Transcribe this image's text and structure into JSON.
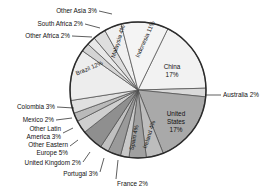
{
  "chart_data": {
    "type": "pie",
    "title": "",
    "subtitle": "",
    "xlabel": "",
    "ylabel": "",
    "legend_position": "none",
    "grid": false,
    "units": "percent",
    "categories": [
      "China",
      "Australia",
      "United States",
      "Ireland",
      "Spain",
      "France",
      "Portugal",
      "United Kingdom",
      "Other Eastern Europe",
      "Other Latin America",
      "Mexico",
      "Colombia",
      "Brazil",
      "Other Africa",
      "South Africa",
      "Other Asia",
      "Malaysia",
      "Indonesia"
    ],
    "values": [
      17,
      2,
      17,
      4,
      4,
      2,
      3,
      2,
      5,
      3,
      2,
      3,
      12,
      2,
      2,
      3,
      4,
      11
    ],
    "slices": [
      {
        "label": "China",
        "value": 17,
        "text": "China 17%",
        "display": [
          "China",
          "17%"
        ],
        "color": "#f2f2f2",
        "label_style": "inside"
      },
      {
        "label": "Australia",
        "value": 2,
        "text": "Australia 2%",
        "display": [
          "Australia 2%"
        ],
        "color": "#d9d9d9",
        "label_style": "leader-right"
      },
      {
        "label": "United States",
        "value": 17,
        "text": "United States 17%",
        "display": [
          "United",
          "States",
          "17%"
        ],
        "color": "#a9a9a9",
        "label_style": "inside"
      },
      {
        "label": "Ireland",
        "value": 4,
        "text": "Ireland 4%",
        "display": [
          "Ireland 4%"
        ],
        "color": "#bdbdbd",
        "label_style": "rotated"
      },
      {
        "label": "Spain",
        "value": 4,
        "text": "Spain 4%",
        "display": [
          "Spain 4%"
        ],
        "color": "#a0a0a0",
        "label_style": "rotated"
      },
      {
        "label": "France",
        "value": 2,
        "text": "France 2%",
        "display": [
          "France 2%"
        ],
        "color": "#c8c8c8",
        "label_style": "leader-bottom"
      },
      {
        "label": "Portugal",
        "value": 3,
        "text": "Portugal 3%",
        "display": [
          "Portugal 3%"
        ],
        "color": "#9a9a9a",
        "label_style": "leader-bottom"
      },
      {
        "label": "United Kingdom",
        "value": 2,
        "text": "United Kingdom 2%",
        "display": [
          "United Kingdom 2%"
        ],
        "color": "#c0c0c0",
        "label_style": "leader-left"
      },
      {
        "label": "Other Eastern Europe",
        "value": 5,
        "text": "Other Eastern Europe 5%",
        "display": [
          "Other Eastern",
          "Europe 5%"
        ],
        "color": "#8f8f8f",
        "label_style": "leader-left"
      },
      {
        "label": "Other Latin America",
        "value": 3,
        "text": "Other Latin America 3%",
        "display": [
          "Other Latin",
          "America 3%"
        ],
        "color": "#cfcfcf",
        "label_style": "leader-left"
      },
      {
        "label": "Mexico",
        "value": 2,
        "text": "Mexico 2%",
        "display": [
          "Mexico 2%"
        ],
        "color": "#bababa",
        "label_style": "leader-left"
      },
      {
        "label": "Colombia",
        "value": 3,
        "text": "Colombia 3%",
        "display": [
          "Colombia 3%"
        ],
        "color": "#e0e0e0",
        "label_style": "leader-left"
      },
      {
        "label": "Brazil",
        "value": 12,
        "text": "Brazil 12%",
        "display": [
          "Brazil 12%"
        ],
        "color": "#ededed",
        "label_style": "rotated"
      },
      {
        "label": "Other Africa",
        "value": 2,
        "text": "Other Africa 2%",
        "display": [
          "Other Africa 2%"
        ],
        "color": "#d4d4d4",
        "label_style": "leader-topleft"
      },
      {
        "label": "South Africa",
        "value": 2,
        "text": "South Africa 2%",
        "display": [
          "South Africa 2%"
        ],
        "color": "#e8e8e8",
        "label_style": "leader-topleft"
      },
      {
        "label": "Other Asia",
        "value": 3,
        "text": "Other Asia 3%",
        "display": [
          "Other Asia 3%"
        ],
        "color": "#dedede",
        "label_style": "leader-topleft"
      },
      {
        "label": "Malaysia",
        "value": 4,
        "text": "Malaysia 4%",
        "display": [
          "Malaysia 4%"
        ],
        "color": "#f0f0f0",
        "label_style": "rotated"
      },
      {
        "label": "Indonesia",
        "value": 11,
        "text": "Indonesia 11%",
        "display": [
          "Indonesia 11%"
        ],
        "color": "#f4f4f4",
        "label_style": "rotated"
      }
    ],
    "colors": {
      "outline": "#2b2b2b",
      "slice_edge": "#4a4a4a",
      "text": "#111111",
      "background": "#ffffff"
    }
  },
  "labels": {
    "other_asia": "Other Asia 3%",
    "south_africa": "South Africa 2%",
    "other_africa": "Other Africa 2%",
    "malaysia": "Malaysia 4%",
    "indonesia": "Indonesia 11%",
    "china_name": "China",
    "china_pct": "17%",
    "australia": "Australia 2%",
    "us_line1": "United",
    "us_line2": "States",
    "us_pct": "17%",
    "ireland": "Ireland 4%",
    "spain": "Spain 4%",
    "france": "France 2%",
    "portugal": "Portugal 3%",
    "united_kingdom": "United Kingdom 2%",
    "other_eastern_europe_l1": "Other Eastern",
    "other_eastern_europe_l2": "Europe 5%",
    "other_latin_america_l1": "Other Latin",
    "other_latin_america_l2": "America 3%",
    "mexico": "Mexico 2%",
    "colombia": "Colombia 3%",
    "brazil": "Brazil 12%"
  }
}
